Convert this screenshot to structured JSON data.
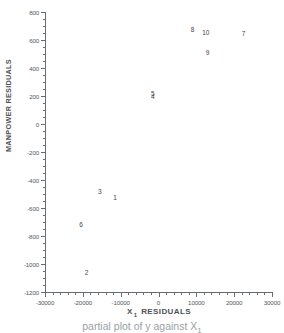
{
  "chart_data": {
    "type": "scatter",
    "title": "",
    "xlabel": "X 1 RESIDUALS",
    "xlabel_base": "X",
    "xlabel_sub": "1",
    "xlabel_rest": "RESIDUALS",
    "ylabel": "MANPOWER RESIDUALS",
    "xlim": [
      -30000,
      30000
    ],
    "ylim": [
      -1200,
      800
    ],
    "xticks": [
      -30000,
      -20000,
      -10000,
      0,
      10000,
      20000,
      30000
    ],
    "xtick_labels": [
      "-30000",
      "-20000",
      "-10000",
      "0",
      "10000",
      "20000",
      "30000"
    ],
    "yticks": [
      -1200,
      -1000,
      -800,
      -600,
      -400,
      -200,
      0,
      200,
      400,
      600,
      800
    ],
    "ytick_labels": [
      "-1200",
      "-1000",
      "-800",
      "-600",
      "-400",
      "-200",
      "0",
      "200",
      "400",
      "600",
      "800"
    ],
    "x_minor_interval": 2000,
    "y_minor_interval": 50,
    "grid": false,
    "legend": null,
    "marker_style": "numeric-label",
    "points": [
      {
        "label": "1",
        "x": -11500,
        "y": -530
      },
      {
        "label": "2",
        "x": -19000,
        "y": -1065
      },
      {
        "label": "3",
        "x": -15500,
        "y": -485
      },
      {
        "label": "4",
        "x": -1500,
        "y": 190
      },
      {
        "label": "5",
        "x": -1500,
        "y": 215
      },
      {
        "label": "6",
        "x": -20500,
        "y": -720
      },
      {
        "label": "7",
        "x": 22500,
        "y": 640
      },
      {
        "label": "8",
        "x": 9000,
        "y": 670
      },
      {
        "label": "9",
        "x": 13000,
        "y": 510
      },
      {
        "label": "10",
        "x": 12500,
        "y": 650
      }
    ]
  },
  "caption": {
    "text": "partial plot of y against X 1",
    "base": "partial plot of y against X",
    "sub": "1"
  },
  "colors": {
    "axis": "#6a6d71",
    "text": "#55585c",
    "marker": "#3f4246",
    "background": "#ffffff"
  }
}
